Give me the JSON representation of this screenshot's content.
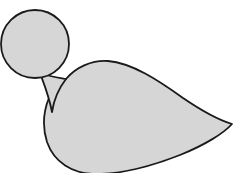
{
  "figure": {
    "title": "Bird silhouette line drawing",
    "canvas": {
      "width": 240,
      "height": 173,
      "background_color": "#ffffff"
    },
    "style": {
      "fill_color": "#d6d6d6",
      "stroke_color": "#1a1a1a",
      "stroke_width": 1.8,
      "line_style": "solid"
    },
    "parts": [
      {
        "id": "head",
        "label": "Head",
        "shape": "circle",
        "center_x": 35,
        "center_y": 44,
        "radius": 34,
        "fill_color": "#d6d6d6",
        "stroke_color": "#1a1a1a"
      },
      {
        "id": "neck",
        "label": "Neck",
        "shape": "tapered-connector",
        "fill_color": "#d6d6d6",
        "stroke_color": "#1a1a1a",
        "path": "M 40 73 C 44 84, 49 96, 52 112 C 54 99, 59 88, 66 79 C 61 78, 52 77, 40 73 Z"
      },
      {
        "id": "body",
        "label": "Body",
        "shape": "teardrop",
        "fill_color": "#d6d6d6",
        "stroke_color": "#1a1a1a",
        "path": "M 66 79 C 76 67, 92 60, 108 61 C 132 63, 158 80, 183 98 C 205 113, 222 121, 232 124 C 224 133, 205 145, 180 155 C 152 166, 120 174, 96 174 C 72 174, 54 162, 47 142 C 40 120, 46 99, 56 86 C 59 82, 63 80, 66 79 Z"
      }
    ],
    "geometry_notes": {
      "head_top_y": 10,
      "head_bottom_y": 78,
      "head_left_x": 1,
      "head_right_x": 69,
      "body_top_peak": {
        "x": 108,
        "y": 61
      },
      "body_left_extreme": {
        "x": 43,
        "y": 126
      },
      "tail_tip": {
        "x": 233,
        "y": 123
      },
      "body_clipped_at_bottom": true
    }
  }
}
